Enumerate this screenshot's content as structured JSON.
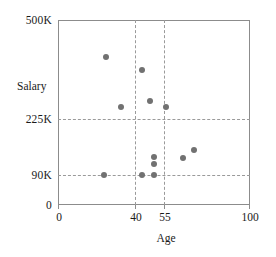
{
  "chart_data": {
    "type": "scatter",
    "title": "",
    "xlabel": "Age",
    "ylabel": "Salary",
    "xlim": [
      0,
      100
    ],
    "ylim": [
      0,
      500
    ],
    "y_unit": "K",
    "grid": true,
    "legend": "none",
    "marker_color": "#717171",
    "frame_color": "#8c8c8c",
    "gridline_color": "#9a9a9a",
    "xticks": [
      {
        "value": 0,
        "label": "0"
      },
      {
        "value": 40,
        "label": "40"
      },
      {
        "value": 55,
        "label": "55"
      },
      {
        "value": 100,
        "label": "100"
      }
    ],
    "yticks": [
      {
        "value": 0,
        "label": "0"
      },
      {
        "value": 90,
        "label": "90K"
      },
      {
        "value": 225,
        "label": "225K"
      },
      {
        "value": 500,
        "label": "500K"
      }
    ],
    "x_gridlines": [
      40,
      55
    ],
    "y_gridlines": [
      90,
      225
    ],
    "points": [
      {
        "x": 25,
        "y": 400
      },
      {
        "x": 33,
        "y": 265
      },
      {
        "x": 44,
        "y": 365
      },
      {
        "x": 48,
        "y": 280
      },
      {
        "x": 56,
        "y": 265
      },
      {
        "x": 50,
        "y": 130
      },
      {
        "x": 50,
        "y": 112
      },
      {
        "x": 50,
        "y": 82
      },
      {
        "x": 44,
        "y": 80
      },
      {
        "x": 24,
        "y": 80
      },
      {
        "x": 65,
        "y": 128
      },
      {
        "x": 71,
        "y": 148
      }
    ]
  }
}
